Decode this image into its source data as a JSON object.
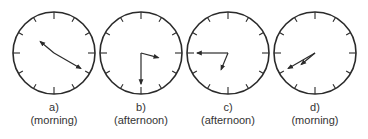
{
  "colors": {
    "stroke": "#2a2a2a",
    "text": "#333333",
    "background": "#ffffff"
  },
  "clocks": [
    {
      "letter": "a)",
      "period": "(morning)",
      "cx": 54,
      "hour": 10,
      "minute": 20
    },
    {
      "letter": "b)",
      "period": "(afternoon)",
      "cx": 141,
      "hour": 3,
      "minute": 30
    },
    {
      "letter": "c)",
      "period": "(afternoon)",
      "cx": 228,
      "hour": 6,
      "minute": 45
    },
    {
      "letter": "d)",
      "period": "(morning)",
      "cx": 315,
      "hour": 7,
      "minute": 40
    }
  ]
}
